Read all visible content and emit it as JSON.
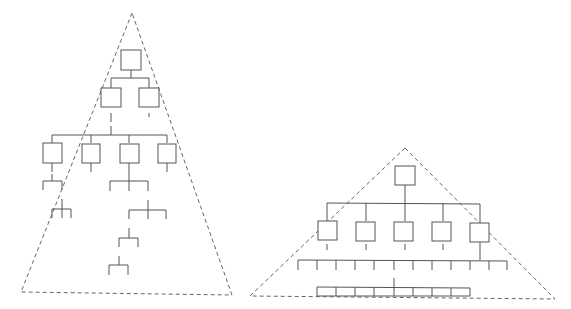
{
  "diagram": {
    "colors": {
      "line": "#555555",
      "dashed": "#666666",
      "background": "#ffffff"
    },
    "tall_hierarchy": {
      "triangle": {
        "apex": [
          132,
          13
        ],
        "base_left": [
          21,
          292
        ],
        "base_right": [
          232,
          295
        ]
      },
      "levels": [
        {
          "level": 1,
          "boxes": 1
        },
        {
          "level": 2,
          "boxes": 2
        },
        {
          "level": 3,
          "boxes": 4
        },
        {
          "level": 4,
          "branch_groups": 2
        },
        {
          "level": 5,
          "branch_groups": 2
        },
        {
          "level": 6,
          "branch_groups": 1
        },
        {
          "level": 7,
          "branch_groups": 1
        }
      ]
    },
    "flat_hierarchy": {
      "triangle": {
        "apex": [
          405,
          148
        ],
        "base_left": [
          250,
          296
        ],
        "base_right": [
          555,
          299
        ]
      },
      "levels": [
        {
          "level": 1,
          "boxes": 1
        },
        {
          "level": 2,
          "boxes": 5
        },
        {
          "level": 3,
          "ticks": 12
        },
        {
          "level": 4,
          "ticks": 9
        }
      ]
    }
  }
}
